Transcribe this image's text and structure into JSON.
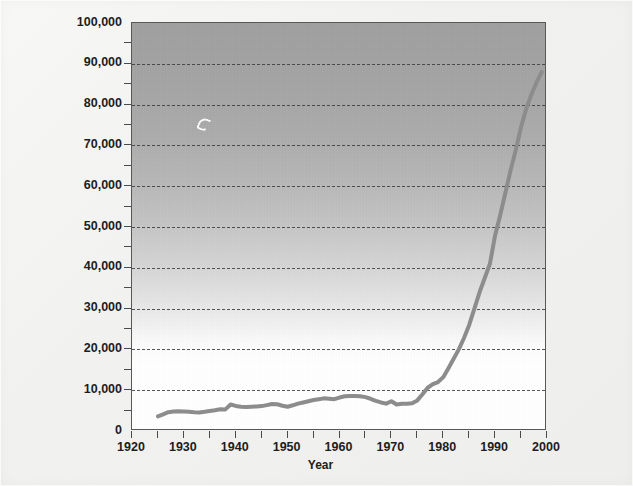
{
  "chart_data": {
    "type": "line",
    "title": "",
    "subtitle": "",
    "xlabel": "Year",
    "ylabel": "",
    "xlim": [
      1920,
      2000
    ],
    "ylim": [
      0,
      100000
    ],
    "grid": true,
    "grid_orientation": "horizontal",
    "grid_style": "dashed",
    "legend": false,
    "legend_position": "none",
    "y_ticks_major": [
      0,
      10000,
      20000,
      30000,
      40000,
      50000,
      60000,
      70000,
      80000,
      90000,
      100000
    ],
    "y_ticklabels": [
      "0",
      "10,000",
      "20,000",
      "30,000",
      "40,000",
      "50,000",
      "60,000",
      "70,000",
      "80,000",
      "90,000",
      "100,000"
    ],
    "y_ticks_minor": [
      5000,
      15000,
      25000,
      35000,
      45000,
      55000,
      65000,
      75000,
      85000,
      95000
    ],
    "x_ticks_major": [
      1920,
      1930,
      1940,
      1950,
      1960,
      1970,
      1980,
      1990,
      2000
    ],
    "x_ticklabels": [
      "1920",
      "1930",
      "1940",
      "1950",
      "1960",
      "1970",
      "1980",
      "1990",
      "2000"
    ],
    "x_ticks_minor": [
      1925,
      1935,
      1945,
      1955,
      1965,
      1975,
      1985,
      1995
    ],
    "series": [
      {
        "name": "value",
        "color": "#8c8c8c",
        "line_width": 4,
        "x": [
          1925,
          1926,
          1927,
          1928,
          1929,
          1930,
          1931,
          1932,
          1933,
          1934,
          1935,
          1936,
          1937,
          1938,
          1939,
          1940,
          1941,
          1942,
          1943,
          1944,
          1945,
          1946,
          1947,
          1948,
          1949,
          1950,
          1951,
          1952,
          1953,
          1954,
          1955,
          1956,
          1957,
          1958,
          1959,
          1960,
          1961,
          1962,
          1963,
          1964,
          1965,
          1966,
          1967,
          1968,
          1969,
          1970,
          1971,
          1972,
          1973,
          1974,
          1975,
          1976,
          1977,
          1978,
          1979,
          1980,
          1981,
          1982,
          1983,
          1984,
          1985,
          1986,
          1987,
          1988,
          1989,
          1990,
          1991,
          1992,
          1993,
          1994,
          1995,
          1996,
          1997,
          1998,
          1999
        ],
        "y": [
          3600,
          4100,
          4600,
          4800,
          4850,
          4800,
          4700,
          4600,
          4550,
          4700,
          4900,
          5100,
          5350,
          5300,
          6500,
          6150,
          5950,
          5900,
          5950,
          6000,
          6100,
          6350,
          6600,
          6550,
          6200,
          5950,
          6300,
          6700,
          7000,
          7300,
          7600,
          7800,
          8000,
          7900,
          7800,
          8200,
          8500,
          8600,
          8600,
          8500,
          8300,
          7900,
          7400,
          7000,
          6700,
          7300,
          6500,
          6700,
          6700,
          6800,
          7500,
          9000,
          10600,
          11500,
          12000,
          13200,
          15400,
          17700,
          20000,
          22800,
          26000,
          30000,
          34000,
          37500,
          41000,
          48000,
          53000,
          58500,
          64000,
          69000,
          74500,
          79000,
          82500,
          85500,
          88000
        ],
        "marker": "none"
      }
    ],
    "annotations": []
  },
  "axes": {
    "x_axis_title": "Year"
  },
  "icons": {
    "artifact": "scan-speck-artifact"
  },
  "colors": {
    "series_line": "#8c8c8c",
    "gridline": "#3a3a3a",
    "axis": "#585858",
    "plot_bg_top": "#a0a0a0",
    "plot_bg_bottom": "#ffffff",
    "page_bg": "#f1f1f0",
    "text": "#1d1d1d"
  }
}
